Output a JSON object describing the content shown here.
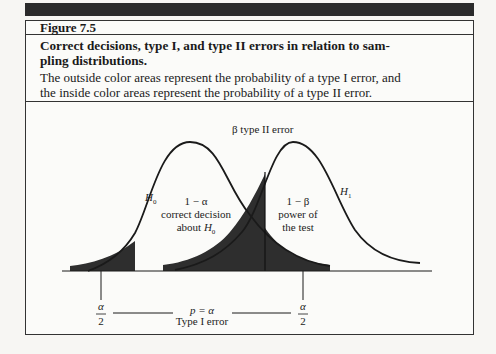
{
  "figure": {
    "number": "Figure 7.5",
    "title_line1": "Correct decisions, type I, and type II errors in relation to sam-",
    "title_line2": "pling distributions.",
    "description_line1": "The outside color areas represent the probability of a type I error, and",
    "description_line2": "the inside color areas represent the probability of a type II error."
  },
  "diagram": {
    "labels": {
      "beta": "β type II error",
      "h0": "H",
      "h0_sub": "0",
      "h1": "H",
      "h1_sub": "1",
      "one_minus_alpha": "1 − α",
      "correct_decision": "correct decision",
      "about_h0_prefix": "about ",
      "about_h0_sub": "0",
      "one_minus_beta": "1 − β",
      "power_of": "power of",
      "the_test": "the test",
      "alpha_num_left": "α",
      "alpha_den_left": "2",
      "alpha_num_right": "α",
      "alpha_den_right": "2",
      "p_alpha": "p = α",
      "type1": "Type I error"
    },
    "colors": {
      "shade": "#2e2e2e",
      "line": "#1a1a1a"
    }
  }
}
